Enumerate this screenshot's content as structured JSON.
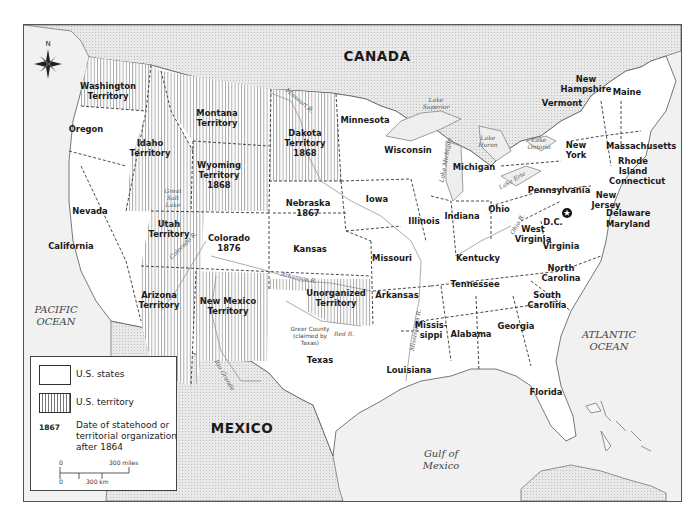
{
  "map": {
    "compass": {
      "north_label": "N"
    },
    "countries": [
      {
        "id": "canada",
        "label": "CANADA"
      },
      {
        "id": "mexico",
        "label": "MEXICO"
      }
    ],
    "water_bodies": [
      {
        "id": "pacific",
        "label": "PACIFIC\nOCEAN"
      },
      {
        "id": "atlantic",
        "label": "ATLANTIC\nOCEAN"
      },
      {
        "id": "gulf",
        "label": "Gulf of\nMexico"
      },
      {
        "id": "superior",
        "label": "Lake\nSuperior"
      },
      {
        "id": "michigan-lake",
        "label": "Lake Michigan"
      },
      {
        "id": "huron",
        "label": "Lake\nHuron"
      },
      {
        "id": "ontario",
        "label": "Lake\nOntario"
      },
      {
        "id": "erie",
        "label": "Lake Erie"
      },
      {
        "id": "great-salt",
        "label": "Great\nSalt\nLake"
      }
    ],
    "rivers": [
      {
        "id": "missouri-r",
        "label": "Missouri R."
      },
      {
        "id": "colorado-r",
        "label": "Colorado R."
      },
      {
        "id": "arkansas-r",
        "label": "Arkansas R."
      },
      {
        "id": "red-r",
        "label": "Red R."
      },
      {
        "id": "mississippi-r",
        "label": "Mississippi R."
      },
      {
        "id": "ohio-r",
        "label": "Ohio R."
      },
      {
        "id": "rio-grande",
        "label": "Rio Grande"
      }
    ],
    "regions": [
      {
        "id": "washington",
        "label": "Washington\nTerritory",
        "type": "territory"
      },
      {
        "id": "oregon",
        "label": "Oregon",
        "type": "state"
      },
      {
        "id": "idaho",
        "label": "Idaho\nTerritory",
        "type": "territory"
      },
      {
        "id": "montana",
        "label": "Montana\nTerritory",
        "type": "territory"
      },
      {
        "id": "wyoming",
        "label": "Wyoming\nTerritory\n1868",
        "type": "territory",
        "year": "1868"
      },
      {
        "id": "dakota",
        "label": "Dakota\nTerritory\n1868",
        "type": "territory",
        "year": "1868"
      },
      {
        "id": "minnesota",
        "label": "Minnesota",
        "type": "state"
      },
      {
        "id": "wisconsin",
        "label": "Wisconsin",
        "type": "state"
      },
      {
        "id": "michigan",
        "label": "Michigan",
        "type": "state"
      },
      {
        "id": "new-york",
        "label": "New\nYork",
        "type": "state"
      },
      {
        "id": "vermont",
        "label": "Vermont",
        "type": "state"
      },
      {
        "id": "new-hampshire",
        "label": "New\nHampshire",
        "type": "state"
      },
      {
        "id": "maine",
        "label": "Maine",
        "type": "state"
      },
      {
        "id": "massachusetts",
        "label": "Massachusetts",
        "type": "state"
      },
      {
        "id": "rhode-island",
        "label": "Rhode\nIsland",
        "type": "state"
      },
      {
        "id": "connecticut",
        "label": "Connecticut",
        "type": "state"
      },
      {
        "id": "new-jersey",
        "label": "New\nJersey",
        "type": "state"
      },
      {
        "id": "delaware",
        "label": "Delaware",
        "type": "state"
      },
      {
        "id": "maryland",
        "label": "Maryland",
        "type": "state"
      },
      {
        "id": "dc",
        "label": "D.C.",
        "type": "capital"
      },
      {
        "id": "pennsylvania",
        "label": "Pennsylvania",
        "type": "state"
      },
      {
        "id": "ohio",
        "label": "Ohio",
        "type": "state"
      },
      {
        "id": "indiana",
        "label": "Indiana",
        "type": "state"
      },
      {
        "id": "illinois",
        "label": "Illinois",
        "type": "state"
      },
      {
        "id": "iowa",
        "label": "Iowa",
        "type": "state"
      },
      {
        "id": "nebraska",
        "label": "Nebraska\n1867",
        "type": "state",
        "year": "1867"
      },
      {
        "id": "nevada",
        "label": "Nevada",
        "type": "state"
      },
      {
        "id": "california",
        "label": "California",
        "type": "state"
      },
      {
        "id": "utah",
        "label": "Utah\nTerritory",
        "type": "territory"
      },
      {
        "id": "colorado",
        "label": "Colorado\n1876",
        "type": "state",
        "year": "1876"
      },
      {
        "id": "kansas",
        "label": "Kansas",
        "type": "state"
      },
      {
        "id": "missouri",
        "label": "Missouri",
        "type": "state"
      },
      {
        "id": "kentucky",
        "label": "Kentucky",
        "type": "state"
      },
      {
        "id": "west-virginia",
        "label": "West\nVirginia",
        "type": "state"
      },
      {
        "id": "virginia",
        "label": "Virginia",
        "type": "state"
      },
      {
        "id": "north-carolina",
        "label": "North\nCarolina",
        "type": "state"
      },
      {
        "id": "tennessee",
        "label": "Tennessee",
        "type": "state"
      },
      {
        "id": "south-carolina",
        "label": "South\nCarolina",
        "type": "state"
      },
      {
        "id": "georgia",
        "label": "Georgia",
        "type": "state"
      },
      {
        "id": "alabama",
        "label": "Alabama",
        "type": "state"
      },
      {
        "id": "mississippi",
        "label": "Missis-\nsippi",
        "type": "state"
      },
      {
        "id": "arkansas",
        "label": "Arkansas",
        "type": "state"
      },
      {
        "id": "louisiana",
        "label": "Louisiana",
        "type": "state"
      },
      {
        "id": "texas",
        "label": "Texas",
        "type": "state"
      },
      {
        "id": "florida",
        "label": "Florida",
        "type": "state"
      },
      {
        "id": "arizona",
        "label": "Arizona\nTerritory",
        "type": "territory"
      },
      {
        "id": "new-mexico",
        "label": "New Mexico\nTerritory",
        "type": "territory"
      },
      {
        "id": "unorganized",
        "label": "Unorganized\nTerritory",
        "type": "territory"
      }
    ],
    "annotations": [
      {
        "id": "greer-county",
        "label": "Greer County\n(claimed by\nTexas)"
      }
    ]
  },
  "legend": {
    "items": [
      {
        "swatch": "plain",
        "label": "U.S. states"
      },
      {
        "swatch": "hatched",
        "label": "U.S. territory"
      },
      {
        "swatch": "year",
        "year": "1867",
        "label": "Date of statehood or\nterritorial organization\nafter 1864"
      }
    ],
    "scale": {
      "top_zero": "0",
      "miles_label": "300 miles",
      "bottom_zero": "0",
      "km_label": "300 km"
    }
  },
  "colors": {
    "state_fill": "#ffffff",
    "territory_hatch": "#7a7a7a",
    "foreign_fill": "#e4e4e4",
    "water_fill": "#f1f1f1",
    "border": "#333333"
  }
}
